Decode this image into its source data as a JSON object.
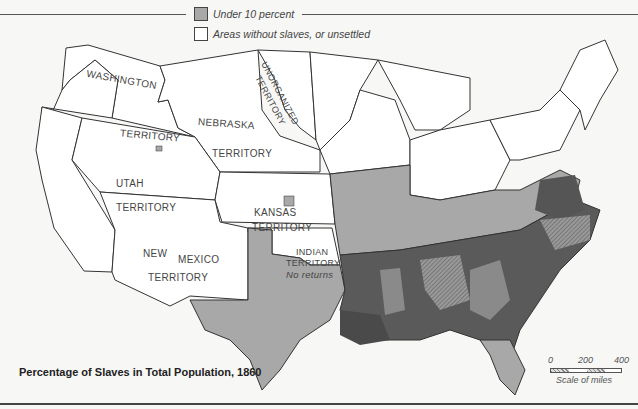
{
  "legend": {
    "items": [
      {
        "label": "Under 10 percent",
        "color": "#a8a8a8"
      },
      {
        "label": "Areas without slaves, or unsettled",
        "color": "#ffffff"
      }
    ]
  },
  "territories": {
    "washington": "WASHINGTON",
    "washington_sub": "TERRITORY",
    "nebraska": "NEBRASKA",
    "nebraska_sub": "TERRITORY",
    "unorganized": "UNORGANIZED",
    "unorganized_sub": "TERRITORY",
    "utah": "UTAH",
    "utah_sub": "TERRITORY",
    "kansas": "KANSAS",
    "kansas_sub": "TERRITORY",
    "new_mexico_a": "NEW",
    "new_mexico_b": "MEXICO",
    "new_mexico_sub": "TERRITORY",
    "indian": "INDIAN",
    "indian_sub": "TERRITORY",
    "indian_note": "No returns"
  },
  "title": "Percentage of Slaves in Total Population, 1860",
  "scale": {
    "ticks": [
      "0",
      "200",
      "400"
    ],
    "caption": "Scale of miles"
  },
  "colors": {
    "high": "#555555",
    "medium": "#7a7a7a",
    "low": "#a8a8a8",
    "none": "#ffffff"
  }
}
